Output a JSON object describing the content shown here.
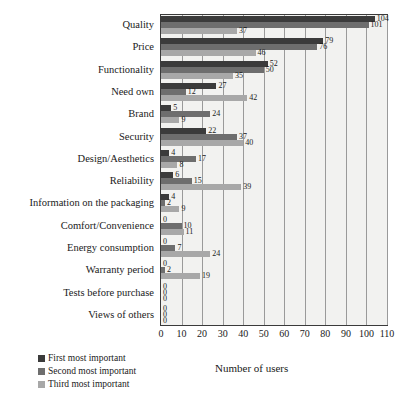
{
  "chart_data": {
    "type": "bar",
    "orientation": "horizontal",
    "title": "",
    "xlabel": "Number of users",
    "ylabel": "",
    "xlim": [
      0,
      110
    ],
    "xticks": [
      0,
      10,
      20,
      30,
      40,
      50,
      60,
      70,
      80,
      90,
      100,
      110
    ],
    "grid": true,
    "legend_position": "bottom-left",
    "categories": [
      "Quality",
      "Price",
      "Functionality",
      "Need own",
      "Brand",
      "Security",
      "Design/Aesthetics",
      "Reliability",
      "Information on the packaging",
      "Comfort/Convenience",
      "Energy consumption",
      "Warranty period",
      "Tests before purchase",
      "Views of others"
    ],
    "series": [
      {
        "name": "First most important",
        "color": "#3b3b3b",
        "values": [
          104,
          79,
          52,
          27,
          5,
          22,
          4,
          6,
          4,
          0,
          0,
          0,
          0,
          0
        ]
      },
      {
        "name": "Second most important",
        "color": "#6e6e6e",
        "values": [
          101,
          76,
          50,
          12,
          24,
          37,
          17,
          15,
          2,
          10,
          7,
          2,
          0,
          0
        ]
      },
      {
        "name": "Third most important",
        "color": "#a8a8a8",
        "values": [
          37,
          46,
          35,
          42,
          9,
          40,
          8,
          39,
          9,
          11,
          24,
          19,
          0,
          0
        ]
      }
    ]
  }
}
